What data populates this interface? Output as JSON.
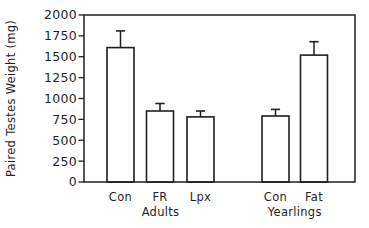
{
  "figure": {
    "background": "#ffffff",
    "line_color": "#1f1f1f",
    "bar_fill": "#ffffff"
  },
  "chart_data": {
    "type": "bar",
    "title": "",
    "xlabel": "",
    "ylabel": "Paired Testes Weight (mg)",
    "ylim": [
      0,
      2000
    ],
    "yticks": [
      0,
      250,
      500,
      750,
      1000,
      1250,
      1500,
      1750,
      2000
    ],
    "grid": false,
    "legend": "none",
    "categories": [
      "Con",
      "FR",
      "Lpx",
      "Con",
      "Fat"
    ],
    "values": [
      1610,
      850,
      780,
      790,
      1520
    ],
    "errors": [
      200,
      90,
      70,
      80,
      160
    ],
    "error_direction": "up",
    "groups": [
      {
        "label": "Adults",
        "category_indexes": [
          0,
          1,
          2
        ]
      },
      {
        "label": "Yearlings",
        "category_indexes": [
          3,
          4
        ]
      }
    ]
  }
}
